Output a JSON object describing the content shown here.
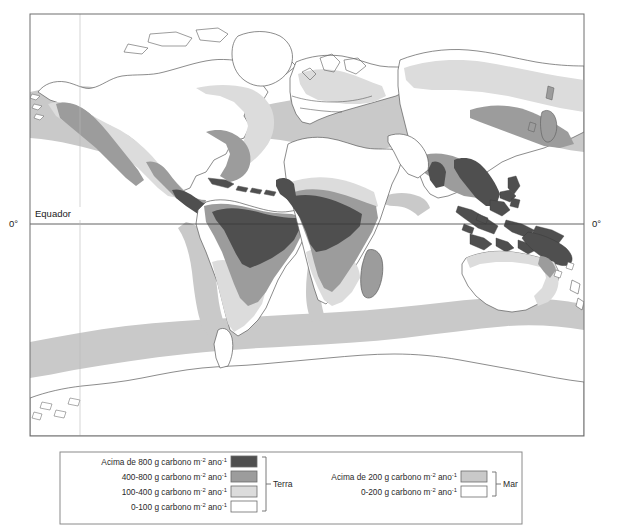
{
  "figure": {
    "type": "thematic-world-map",
    "background_color": "#ffffff",
    "frame_color": "#6e6e6e"
  },
  "map": {
    "equator_line_label": "Equador",
    "latitude_tick_left": "0°",
    "latitude_tick_right": "0°",
    "coastline_color": "#5a5a5a"
  },
  "palette": {
    "land_above_800": "#4f4f4f",
    "land_400_800": "#9c9c9c",
    "land_100_400": "#dcdcdc",
    "land_0_100": "#ffffff",
    "sea_above_200": "#c9c9c9",
    "sea_0_200": "#ffffff",
    "swatch_border": "#6b6b6b",
    "text": "#2a2a2a"
  },
  "legend": {
    "land_group_label": "Terra",
    "sea_group_label": "Mar",
    "unit_base": "g carbono m",
    "unit_exp_area": "-2",
    "unit_mid": " ano",
    "unit_exp_time": "-1",
    "land_items": [
      {
        "label_prefix": "Acima de 800 ",
        "swatch": "land_above_800",
        "value_range": "above 800"
      },
      {
        "label_prefix": "400-800 ",
        "swatch": "land_400_800",
        "value_range": "400-800"
      },
      {
        "label_prefix": "100-400 ",
        "swatch": "land_100_400",
        "value_range": "100-400"
      },
      {
        "label_prefix": "0-100 ",
        "swatch": "land_0_100",
        "value_range": "0-100"
      }
    ],
    "sea_items": [
      {
        "label_prefix": "Acima de 200 ",
        "swatch": "sea_above_200",
        "value_range": "above 200"
      },
      {
        "label_prefix": "0-200 ",
        "swatch": "sea_0_200",
        "value_range": "0-200"
      }
    ]
  }
}
